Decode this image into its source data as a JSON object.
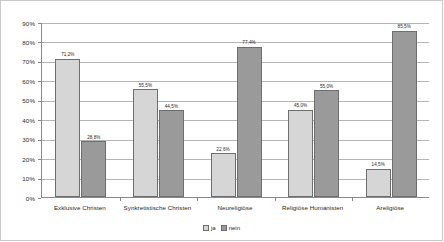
{
  "chart_data": {
    "type": "bar",
    "title": "",
    "subtitle": "",
    "xlabel": "",
    "ylabel": "",
    "categories": [
      "Exklusive Christen",
      "Synkretistische Christen",
      "Neureligiöse",
      "Religiöse Humanisten",
      "Areligiöse"
    ],
    "series": [
      {
        "name": "ja",
        "color": "#d6d6d6",
        "values": [
          71.2,
          55.5,
          22.6,
          45.0,
          14.5
        ],
        "labels": [
          "71,2%",
          "55,5%",
          "22,6%",
          "45,0%",
          "14,5%"
        ]
      },
      {
        "name": "nein",
        "color": "#9a9a9a",
        "values": [
          28.8,
          44.5,
          77.4,
          55.0,
          85.5
        ],
        "labels": [
          "28,8%",
          "44,5%",
          "77,4%",
          "55,0%",
          "85,5%"
        ]
      }
    ],
    "ylim": [
      0,
      90
    ],
    "ytick_values": [
      0,
      10,
      20,
      30,
      40,
      50,
      60,
      70,
      80,
      90
    ],
    "ytick_labels": [
      "0%",
      "10%",
      "20%",
      "30%",
      "40%",
      "50%",
      "60%",
      "70%",
      "80%",
      "90%"
    ],
    "grid": true,
    "grid_axis": "y",
    "legend_position": "bottom-center",
    "value_labels": true
  },
  "legend": {
    "items": [
      {
        "label": "ja",
        "marker": "legend-swatch-ja"
      },
      {
        "label": "nein",
        "marker": "legend-swatch-nein"
      }
    ]
  },
  "colors": {
    "series_ja": "#d6d6d6",
    "series_nein": "#9a9a9a",
    "grid": "#b5b5b5",
    "axis": "#8a8a8a",
    "frame": "#c9c9c9",
    "text": "#1f1f1f",
    "background": "#ffffff"
  }
}
